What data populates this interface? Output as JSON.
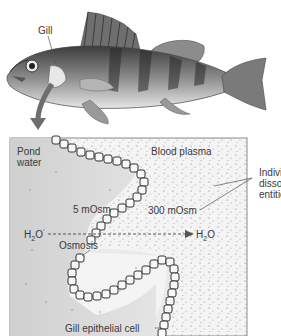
{
  "fish": {
    "gill_label": "Gill"
  },
  "panel": {
    "pond_label": "Pond water",
    "pond_line1": "Pond",
    "pond_line2": "water",
    "plasma_label": "Blood plasma",
    "pond_osm": "5 mOsm",
    "plasma_osm": "300 mOsm",
    "water_left": "H2O",
    "water_right": "H2O",
    "osmosis_label": "Osmosis",
    "cell_label": "Gill epithelial cell",
    "entities_line1": "Individual",
    "entities_line2": "dissolved",
    "entities_line3": "entities"
  },
  "colors": {
    "pond_fill": "#d9d9d9",
    "plasma_fill": "#f2f2f2",
    "arrow": "#6e6e6e",
    "border": "#8a8a8a"
  }
}
